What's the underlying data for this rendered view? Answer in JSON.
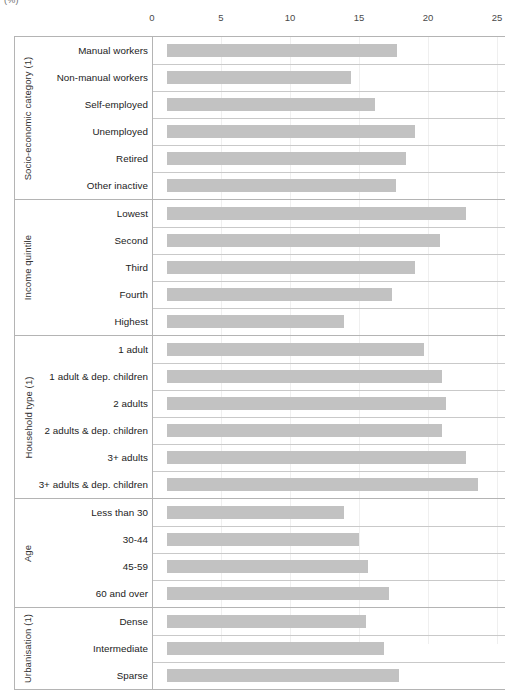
{
  "unit_label": "(%)",
  "axis": {
    "ticks": [
      0,
      5,
      10,
      15,
      20,
      25
    ],
    "min": 0,
    "max": 25,
    "px_left": 152,
    "px_per_unit": 13.8
  },
  "bar_color": "#c2c2c2",
  "chart_data": {
    "type": "bar",
    "orientation": "horizontal",
    "title": "",
    "xlabel": "(%)",
    "ylabel": "",
    "xlim": [
      0,
      25
    ],
    "xticks": [
      0,
      5,
      10,
      15,
      20,
      25
    ],
    "grid": true,
    "legend": "none",
    "groups": [
      {
        "name": "Socio-economic category (1)",
        "categories": [
          "Manual workers",
          "Non-manual workers",
          "Self-employed",
          "Unemployed",
          "Retired",
          "Other inactive"
        ],
        "values": [
          16.7,
          13.3,
          15.1,
          18.0,
          17.3,
          16.6
        ]
      },
      {
        "name": "Income quintile",
        "categories": [
          "Lowest",
          "Second",
          "Third",
          "Fourth",
          "Highest"
        ],
        "values": [
          21.7,
          19.8,
          18.0,
          16.3,
          12.8
        ]
      },
      {
        "name": "Household type (1)",
        "categories": [
          "1 adult",
          "1 adult & dep. children",
          "2 adults",
          "2 adults & dep. children",
          "3+ adults",
          "3+ adults & dep. children"
        ],
        "values": [
          18.6,
          19.9,
          20.2,
          19.9,
          21.7,
          22.5
        ]
      },
      {
        "name": "Age",
        "categories": [
          "Less than 30",
          "30-44",
          "45-59",
          "60 and over"
        ],
        "values": [
          12.8,
          13.9,
          14.6,
          16.1
        ]
      },
      {
        "name": "Urbanisation (1)",
        "categories": [
          "Dense",
          "Intermediate",
          "Sparse"
        ],
        "values": [
          14.4,
          15.7,
          16.8
        ]
      }
    ]
  }
}
